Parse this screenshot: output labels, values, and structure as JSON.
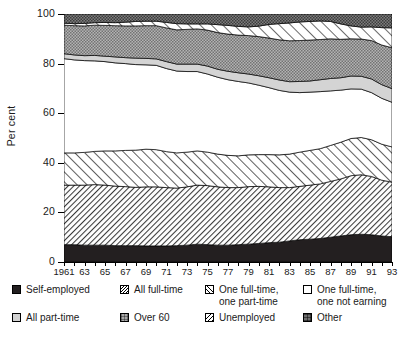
{
  "chart_data": {
    "type": "area",
    "title": "",
    "xlabel": "",
    "ylabel": "Per cent",
    "ylim": [
      0,
      100
    ],
    "yticks": [
      0,
      20,
      40,
      60,
      80,
      100
    ],
    "ytick_labels": [
      "0",
      "20",
      "40",
      "60",
      "80",
      "100"
    ],
    "grid": false,
    "stacked": true,
    "legend_position": "below",
    "x": [
      1961,
      1962,
      1963,
      1964,
      1965,
      1966,
      1967,
      1968,
      1969,
      1970,
      1971,
      1972,
      1973,
      1974,
      1975,
      1976,
      1977,
      1978,
      1979,
      1980,
      1981,
      1982,
      1983,
      1984,
      1985,
      1986,
      1987,
      1988,
      1989,
      1990,
      1991,
      1992,
      1993
    ],
    "xtick_labels": [
      "1961",
      "63",
      "65",
      "67",
      "69",
      "71",
      "73",
      "75",
      "77",
      "79",
      "81",
      "83",
      "85",
      "87",
      "89",
      "91",
      "93"
    ],
    "xtick_values": [
      1961,
      1963,
      1965,
      1967,
      1969,
      1971,
      1973,
      1975,
      1977,
      1979,
      1981,
      1983,
      1985,
      1987,
      1989,
      1991,
      1993
    ],
    "series": [
      {
        "name": "Self-employed",
        "pattern": "solid-dark",
        "color": "#231f20",
        "values": [
          7.0,
          7.0,
          6.8,
          6.8,
          6.8,
          6.6,
          6.6,
          6.6,
          6.5,
          6.5,
          6.5,
          6.6,
          6.8,
          7.2,
          7.0,
          6.8,
          6.8,
          7.0,
          7.2,
          7.5,
          7.8,
          8.0,
          8.5,
          9.0,
          9.2,
          9.5,
          10.0,
          10.5,
          11.0,
          11.2,
          11.0,
          10.5,
          10.2
        ]
      },
      {
        "name": "All full-time",
        "pattern": "dense-hatch",
        "color": "#9a9a9a",
        "values": [
          24.0,
          24.0,
          24.2,
          24.4,
          24.2,
          24.0,
          23.8,
          23.5,
          23.8,
          23.8,
          23.5,
          23.2,
          23.5,
          23.8,
          23.8,
          23.5,
          23.2,
          23.0,
          23.2,
          23.0,
          22.5,
          22.0,
          21.5,
          21.5,
          21.8,
          22.0,
          22.5,
          23.0,
          23.8,
          24.0,
          23.5,
          22.5,
          22.0
        ]
      },
      {
        "name": "One full-time, one part-time",
        "pattern": "diagonal-hatch",
        "color": "#c8c8c8",
        "values": [
          13.0,
          13.0,
          13.2,
          13.4,
          13.8,
          14.2,
          14.6,
          15.0,
          15.2,
          15.0,
          14.5,
          14.2,
          14.0,
          13.8,
          13.5,
          13.2,
          13.0,
          12.8,
          12.8,
          12.8,
          13.0,
          13.2,
          13.5,
          13.8,
          14.0,
          14.2,
          14.5,
          14.8,
          15.0,
          15.0,
          14.8,
          14.5,
          14.2
        ]
      },
      {
        "name": "One full-time, one not earning",
        "pattern": "white",
        "color": "#ffffff",
        "values": [
          38.0,
          37.5,
          37.0,
          36.5,
          36.0,
          35.5,
          35.0,
          34.5,
          34.0,
          34.0,
          33.5,
          33.0,
          32.5,
          32.0,
          31.5,
          31.0,
          30.5,
          30.0,
          29.0,
          28.0,
          27.0,
          26.0,
          25.0,
          24.0,
          23.5,
          23.0,
          22.0,
          21.0,
          20.0,
          19.5,
          19.0,
          18.5,
          18.0
        ]
      },
      {
        "name": "All part-time",
        "pattern": "light-gray",
        "color": "#d2d2d2",
        "values": [
          2.0,
          2.0,
          2.0,
          2.2,
          2.2,
          2.4,
          2.4,
          2.6,
          2.6,
          2.6,
          2.8,
          2.8,
          3.0,
          3.0,
          3.2,
          3.2,
          3.4,
          3.5,
          3.6,
          3.8,
          4.0,
          4.2,
          4.2,
          4.5,
          4.5,
          4.8,
          5.0,
          5.0,
          5.2,
          5.2,
          5.5,
          5.5,
          5.5
        ]
      },
      {
        "name": "Over 60",
        "pattern": "stipple-gray",
        "color": "#a8a8a8",
        "values": [
          11.5,
          11.8,
          12.0,
          12.2,
          12.4,
          12.6,
          12.8,
          13.0,
          13.2,
          13.4,
          13.6,
          13.8,
          14.0,
          14.2,
          14.5,
          14.8,
          15.0,
          15.2,
          15.5,
          15.8,
          16.0,
          16.2,
          16.5,
          16.5,
          16.5,
          16.2,
          16.0,
          15.5,
          15.0,
          15.0,
          15.5,
          16.0,
          16.5
        ]
      },
      {
        "name": "Unemployed",
        "pattern": "sparse-hatch",
        "color": "#ffffff",
        "values": [
          0.8,
          0.8,
          1.0,
          1.0,
          1.2,
          1.2,
          1.5,
          1.8,
          1.8,
          1.8,
          2.2,
          2.5,
          2.2,
          2.0,
          2.5,
          3.2,
          3.5,
          3.5,
          3.5,
          4.2,
          5.5,
          6.5,
          7.2,
          7.5,
          7.5,
          7.5,
          7.0,
          6.2,
          5.2,
          4.8,
          5.5,
          7.0,
          8.0
        ]
      },
      {
        "name": "Other",
        "pattern": "dark-gray-stipple",
        "color": "#6e6e6e",
        "values": [
          3.7,
          3.9,
          3.8,
          3.5,
          3.4,
          3.5,
          3.3,
          3.0,
          2.9,
          2.9,
          3.4,
          3.9,
          4.0,
          4.0,
          4.0,
          4.3,
          4.6,
          5.0,
          5.2,
          4.9,
          4.2,
          3.9,
          3.6,
          3.2,
          3.0,
          2.8,
          3.0,
          4.0,
          4.8,
          5.3,
          5.2,
          5.5,
          5.6
        ]
      }
    ]
  },
  "legend": {
    "items": [
      {
        "label": "Self-employed",
        "label2": "",
        "pattern": "f-self"
      },
      {
        "label": "All full-time",
        "label2": "",
        "pattern": "f-allft"
      },
      {
        "label": "One full-time,",
        "label2": "one part-time",
        "pattern": "f-ftpt"
      },
      {
        "label": "One full-time,",
        "label2": "one not earning",
        "pattern": "f-ftne"
      },
      {
        "label": "All part-time",
        "label2": "",
        "pattern": "f-allpt"
      },
      {
        "label": "Over 60",
        "label2": "",
        "pattern": "f-over60"
      },
      {
        "label": "Unemployed",
        "label2": "",
        "pattern": "f-unemp"
      },
      {
        "label": "Other",
        "label2": "",
        "pattern": "f-other"
      }
    ]
  }
}
